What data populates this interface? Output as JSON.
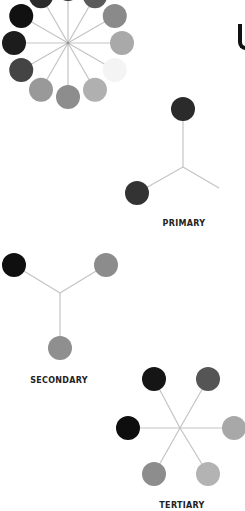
{
  "wheel": {
    "center": [
      68,
      43
    ],
    "spoke_radius": 54,
    "circle_radius": 12,
    "spoke_color": "#c4c4c4",
    "circles": [
      {
        "angle": -90,
        "color": "#333333"
      },
      {
        "angle": -60,
        "color": "#5a5a5a"
      },
      {
        "angle": -30,
        "color": "#8a8a8a"
      },
      {
        "angle": 0,
        "color": "#a9a9a9"
      },
      {
        "angle": 30,
        "color": "#f4f4f4"
      },
      {
        "angle": 60,
        "color": "#b0b0b0"
      },
      {
        "angle": 90,
        "color": "#8d8d8d"
      },
      {
        "angle": 120,
        "color": "#999999"
      },
      {
        "angle": 150,
        "color": "#444444"
      },
      {
        "angle": 180,
        "color": "#1c1c1c"
      },
      {
        "angle": 210,
        "color": "#111111"
      },
      {
        "angle": 240,
        "color": "#2a2a2a"
      }
    ]
  },
  "primary": {
    "label": "PRIMARY",
    "label_pos": [
      184,
      219
    ],
    "hub": [
      183,
      167
    ],
    "spokes": [
      [
        183,
        109
      ],
      [
        137,
        193
      ],
      [
        219,
        188
      ]
    ],
    "circles": [
      {
        "pos": [
          183,
          109
        ],
        "color": "#2b2b2b"
      },
      {
        "pos": [
          137,
          193
        ],
        "color": "#333333"
      }
    ]
  },
  "secondary": {
    "label": "SECONDARY",
    "label_pos": [
      59,
      376
    ],
    "hub": [
      60,
      293
    ],
    "spokes": [
      [
        14,
        265
      ],
      [
        106,
        265
      ],
      [
        60,
        348
      ]
    ],
    "circles": [
      {
        "pos": [
          14,
          265
        ],
        "color": "#0f0f0f"
      },
      {
        "pos": [
          106,
          265
        ],
        "color": "#8c8c8c"
      },
      {
        "pos": [
          60,
          348
        ],
        "color": "#8f8f8f"
      }
    ]
  },
  "tertiary": {
    "label": "TERTIARY",
    "label_pos": [
      182,
      501
    ],
    "hub": [
      180,
      428
    ],
    "spokes": [
      [
        154,
        379
      ],
      [
        208,
        379
      ],
      [
        128,
        428
      ],
      [
        234,
        428
      ],
      [
        154,
        474
      ],
      [
        208,
        474
      ]
    ],
    "circles": [
      {
        "pos": [
          154,
          379
        ],
        "color": "#151515"
      },
      {
        "pos": [
          208,
          379
        ],
        "color": "#555555"
      },
      {
        "pos": [
          128,
          428
        ],
        "color": "#0e0e0e"
      },
      {
        "pos": [
          234,
          428
        ],
        "color": "#a8a8a8"
      },
      {
        "pos": [
          154,
          474
        ],
        "color": "#8d8d8d"
      },
      {
        "pos": [
          208,
          474
        ],
        "color": "#b3b3b3"
      }
    ]
  },
  "colors": {
    "spoke": "#c4c4c4",
    "label_text": "#222222",
    "background": "#ffffff"
  }
}
